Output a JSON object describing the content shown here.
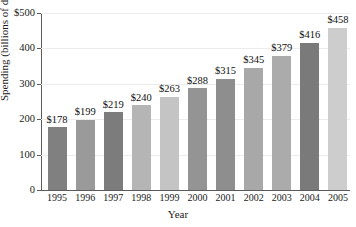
{
  "chart_data": {
    "type": "bar",
    "title": "",
    "xlabel": "Year",
    "ylabel": "Spending (billions of dollars)",
    "categories": [
      "1995",
      "1996",
      "1997",
      "1998",
      "1999",
      "2000",
      "2001",
      "2002",
      "2003",
      "2004",
      "2005"
    ],
    "values": [
      178,
      199,
      219,
      240,
      263,
      288,
      315,
      345,
      379,
      416,
      458
    ],
    "value_labels": [
      "$178",
      "$199",
      "$219",
      "$240",
      "$263",
      "$288",
      "$315",
      "$345",
      "$379",
      "$416",
      "$458"
    ],
    "bar_colors": [
      "#808080",
      "#9a9a9a",
      "#7c7c7c",
      "#b5b5b5",
      "#c4c4c4",
      "#949494",
      "#8e8e8e",
      "#a8a8a8",
      "#ababab",
      "#7a7a7a",
      "#cdcdcd"
    ],
    "ylim": [
      0,
      500
    ],
    "ytick_values": [
      0,
      100,
      200,
      300,
      400,
      500
    ],
    "ytick_labels": [
      "0",
      "100",
      "200",
      "300",
      "400",
      "$500"
    ],
    "grid": true,
    "grid_color": "#ececec",
    "legend": null,
    "axis_color": "#5a5a5a"
  }
}
